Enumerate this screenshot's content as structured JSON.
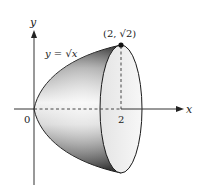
{
  "figure": {
    "axes": {
      "x_label": "x",
      "y_label": "y",
      "origin_label": "0",
      "x_tick_label": "2"
    },
    "curve_label": "y = √x",
    "point_label": "(2, √2)",
    "colors": {
      "axis": "#333333",
      "outline": "#1a1a1a",
      "face_fill": "#f0f0f0",
      "shade_dark": "#3a3a3a",
      "shade_light": "#f4f4f4"
    }
  }
}
